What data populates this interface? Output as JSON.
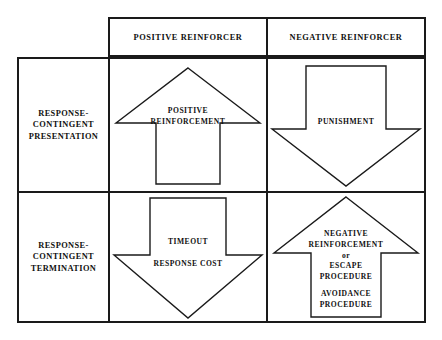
{
  "diagram": {
    "columns": [
      {
        "id": "positive-reinforcer",
        "label": "POSITIVE REINFORCER"
      },
      {
        "id": "negative-reinforcer",
        "label": "NEGATIVE REINFORCER"
      }
    ],
    "rows": [
      {
        "id": "response-contingent-presentation",
        "label": "RESPONSE-\nCONTINGENT\nPRESENTATION"
      },
      {
        "id": "response-contingent-termination",
        "label": "RESPONSE-\nCONTINGENT\nTERMINATION"
      }
    ],
    "cells": [
      {
        "id": "positive-reinforcement",
        "row": "response-contingent-presentation",
        "column": "positive-reinforcer",
        "arrow": "up",
        "arrow_icon": "arrow-up-icon",
        "text": "POSITIVE\nREINFORCEMENT"
      },
      {
        "id": "punishment",
        "row": "response-contingent-presentation",
        "column": "negative-reinforcer",
        "arrow": "down",
        "arrow_icon": "arrow-down-icon",
        "text": "PUNISHMENT"
      },
      {
        "id": "timeout-response-cost",
        "row": "response-contingent-termination",
        "column": "positive-reinforcer",
        "arrow": "down",
        "arrow_icon": "arrow-down-icon",
        "text": "TIMEOUT\n\nRESPONSE COST"
      },
      {
        "id": "negative-reinforcement",
        "row": "response-contingent-termination",
        "column": "negative-reinforcer",
        "arrow": "up",
        "arrow_icon": "arrow-up-icon",
        "text_primary": "NEGATIVE\nREINFORCEMENT\nor\nESCAPE\nPROCEDURE",
        "text_secondary": "AVOIDANCE\nPROCEDURE"
      }
    ],
    "colors": {
      "line": "#1a1a1a",
      "text": "#111111",
      "background": "#ffffff"
    }
  }
}
